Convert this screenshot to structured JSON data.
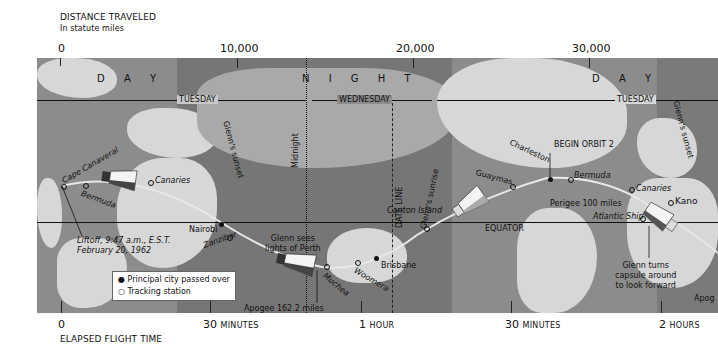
{
  "header": {
    "title": "DISTANCE TRAVELED",
    "subtitle": "In statute miles"
  },
  "distance_scale": [
    "0",
    "10,000",
    "20,000",
    "30,000"
  ],
  "time_scale": {
    "ticks": [
      {
        "num": "0",
        "unit": ""
      },
      {
        "num": "30",
        "unit": "MINUTES"
      },
      {
        "num": "1",
        "unit": "HOUR"
      },
      {
        "num": "30",
        "unit": "MINUTES"
      },
      {
        "num": "2",
        "unit": "HOURS"
      }
    ],
    "title": "ELAPSED FLIGHT TIME"
  },
  "bands": {
    "day_left": "D  A  Y",
    "night": "N  I  G  H  T",
    "day_right": "D  A  Y"
  },
  "days": {
    "tuesday_left": "TUESDAY",
    "wednesday": "WEDNESDAY",
    "tuesday_right": "TUESDAY"
  },
  "lines": {
    "glenns_sunset_1": "Glenn's sunset",
    "midnight": "Midnight",
    "date_line": "DATE LINE",
    "glenns_sunrise": "Glenn's sunrise",
    "glenns_sunset_2": "Glenn's sunset",
    "equator": "EQUATOR"
  },
  "places": {
    "cape_canaveral": "Cape Canaveral",
    "bermuda_1": "Bermuda",
    "canaries_1": "Canaries",
    "nairobi": "Nairobi",
    "zanzibar": "Zanzibar",
    "muchea": "Muchea",
    "woomera": "Woomera",
    "brisbane": "Brisbane",
    "canton_island": "Canton Island",
    "guaymas": "Guaymas",
    "charleston": "Charleston",
    "bermuda_2": "Bermuda",
    "canaries_2": "Canaries",
    "kano": "Kano",
    "atlantic_ship": "Atlantic Ship"
  },
  "annotations": {
    "liftoff_1": "Liftoff, 9:47 a.m., E.S.T.",
    "liftoff_2": "February 20, 1962",
    "perth_1": "Glenn sees",
    "perth_2": "lights of Perth",
    "apogee": "Apogee 162.2 miles",
    "perigee": "Perigee 100 miles",
    "begin_orbit": "BEGIN ORBIT 2",
    "turns_1": "Glenn turns",
    "turns_2": "capsule around",
    "turns_3": "to look forward",
    "apogee_edge": "Apog"
  },
  "legend": {
    "principal": "Principal city passed over",
    "tracking": "Tracking station"
  },
  "colors": {
    "ocean": "#8c8c8c",
    "night": "#767676",
    "land_day": "#d7d7d7"
  }
}
